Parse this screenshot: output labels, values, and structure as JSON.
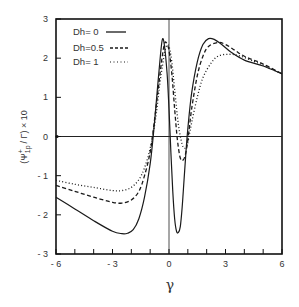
{
  "chart_data": {
    "type": "line",
    "title": "",
    "xlabel": "γ",
    "ylabel": "(Ψ⁺1p / Γ) × 10",
    "xlim": [
      -6,
      6
    ],
    "ylim": [
      -3,
      3
    ],
    "x_ticks": [
      -6,
      -5,
      -4,
      -3,
      -2,
      -1,
      0,
      1,
      2,
      3,
      4,
      5,
      6
    ],
    "x_tick_labels": [
      "-6",
      "-3",
      "0",
      "3",
      "6"
    ],
    "x_tick_label_values": [
      -6,
      -3,
      0,
      3,
      6
    ],
    "y_ticks": [
      -3,
      -2,
      -1,
      0,
      1,
      2,
      3
    ],
    "y_tick_labels": [
      "3",
      "2",
      "1",
      "0",
      "-1",
      "-2",
      "-3"
    ],
    "grid": false,
    "zero_lines": true,
    "legend_position": "upper-left",
    "series": [
      {
        "name": "Dh= 0",
        "style": "solid",
        "x": [
          -6,
          -5,
          -4,
          -3,
          -2.5,
          -2.2,
          -1.9,
          -1.6,
          -1.3,
          -1.0,
          -0.8,
          -0.6,
          -0.45,
          -0.35,
          -0.25,
          -0.1,
          0.0,
          0.1,
          0.2,
          0.3,
          0.4,
          0.5,
          0.6,
          0.7,
          0.8,
          0.9,
          1.0,
          1.2,
          1.5,
          1.8,
          2.1,
          2.4,
          2.8,
          3.3,
          4,
          5,
          6
        ],
        "y": [
          -1.55,
          -1.85,
          -2.15,
          -2.42,
          -2.48,
          -2.47,
          -2.38,
          -2.1,
          -1.55,
          -0.7,
          0.2,
          1.3,
          2.1,
          2.48,
          2.35,
          1.6,
          0.7,
          -0.4,
          -1.4,
          -2.1,
          -2.42,
          -2.45,
          -2.3,
          -1.8,
          -1.1,
          -0.4,
          0.2,
          1.1,
          1.9,
          2.35,
          2.5,
          2.48,
          2.35,
          2.15,
          1.95,
          1.8,
          1.6
        ]
      },
      {
        "name": "Dh=0.5",
        "style": "dashed",
        "x": [
          -6,
          -5,
          -4,
          -3,
          -2.5,
          -2.0,
          -1.6,
          -1.3,
          -1.0,
          -0.8,
          -0.6,
          -0.4,
          -0.25,
          -0.15,
          0.0,
          0.15,
          0.3,
          0.45,
          0.6,
          0.75,
          0.9,
          1.05,
          1.2,
          1.5,
          1.8,
          2.1,
          2.6,
          3.0,
          3.5,
          4,
          5,
          6
        ],
        "y": [
          -1.25,
          -1.4,
          -1.55,
          -1.68,
          -1.7,
          -1.62,
          -1.4,
          -1.0,
          -0.4,
          0.3,
          1.1,
          1.9,
          2.35,
          2.4,
          2.2,
          1.6,
          0.7,
          -0.1,
          -0.55,
          -0.6,
          -0.4,
          0.1,
          0.7,
          1.55,
          2.05,
          2.3,
          2.4,
          2.35,
          2.2,
          2.05,
          1.85,
          1.6
        ]
      },
      {
        "name": "Dh= 1",
        "style": "dotted",
        "x": [
          -6,
          -5,
          -4,
          -3,
          -2.5,
          -2.0,
          -1.6,
          -1.3,
          -1.0,
          -0.7,
          -0.5,
          -0.3,
          -0.15,
          0.0,
          0.15,
          0.3,
          0.5,
          0.7,
          0.85,
          1.0,
          1.2,
          1.5,
          1.8,
          2.2,
          2.6,
          3.2,
          3.8,
          4.5,
          5,
          6
        ],
        "y": [
          -1.12,
          -1.22,
          -1.3,
          -1.38,
          -1.38,
          -1.3,
          -1.1,
          -0.8,
          -0.3,
          0.5,
          1.3,
          1.95,
          2.3,
          2.3,
          1.9,
          1.2,
          0.3,
          -0.2,
          -0.3,
          -0.15,
          0.35,
          1.0,
          1.5,
          1.85,
          2.05,
          2.1,
          2.05,
          1.92,
          1.82,
          1.6
        ]
      }
    ]
  },
  "legend": {
    "items": [
      {
        "label": "Dh= 0"
      },
      {
        "label": "Dh=0.5"
      },
      {
        "label": "Dh= 1"
      }
    ]
  },
  "axes": {
    "xlabel": "γ",
    "ylabel_main": "(Ψ",
    "ylabel_sup": "+",
    "ylabel_sub": "1p",
    "ylabel_tail": "/ Γ) × 10"
  },
  "colors": {
    "line": "#1a1a1a",
    "axis": "#111111",
    "text": "#333333"
  }
}
